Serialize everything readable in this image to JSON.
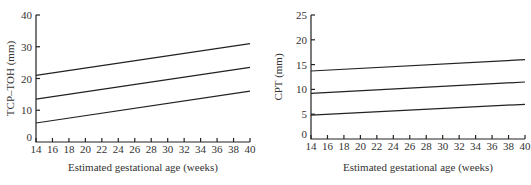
{
  "chart_data": [
    {
      "type": "line",
      "title": "",
      "xlabel": "Estimated gestational age (weeks)",
      "ylabel": "TCP–TOH (mm)",
      "xlim": [
        14,
        40
      ],
      "ylim": [
        0,
        40
      ],
      "x_ticks": [
        14,
        16,
        18,
        20,
        22,
        24,
        26,
        28,
        30,
        32,
        34,
        36,
        38,
        40
      ],
      "y_ticks": [
        0,
        10,
        20,
        30,
        40
      ],
      "grid": false,
      "legend": null,
      "x": [
        14,
        40
      ],
      "series": [
        {
          "name": "upper",
          "values": [
            21,
            31
          ]
        },
        {
          "name": "middle",
          "values": [
            13.5,
            23.5
          ]
        },
        {
          "name": "lower",
          "values": [
            6,
            16
          ]
        }
      ]
    },
    {
      "type": "line",
      "title": "",
      "xlabel": "Estimated gestational age (weeks)",
      "ylabel": "CPT (mm)",
      "xlim": [
        14,
        40
      ],
      "ylim": [
        0,
        25
      ],
      "x_ticks": [
        14,
        16,
        18,
        20,
        22,
        24,
        26,
        28,
        30,
        32,
        34,
        36,
        38,
        40
      ],
      "y_ticks": [
        0,
        5,
        10,
        15,
        20,
        25
      ],
      "grid": false,
      "legend": null,
      "x": [
        14,
        40
      ],
      "series": [
        {
          "name": "upper",
          "values": [
            13.7,
            16
          ]
        },
        {
          "name": "middle",
          "values": [
            9.2,
            11.5
          ]
        },
        {
          "name": "lower",
          "values": [
            4.8,
            7
          ]
        }
      ]
    }
  ]
}
